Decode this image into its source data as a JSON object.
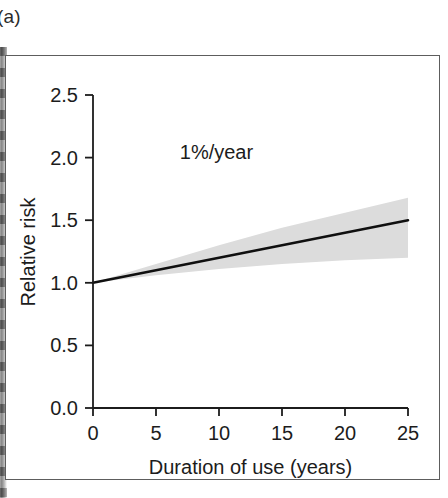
{
  "panel": {
    "label": "(a)"
  },
  "colors": {
    "axis": "#1c1c1c",
    "frame": "#5d5d5d",
    "trend_line": "#101010",
    "confidence_band": "#dcdcdc",
    "background": "#ffffff",
    "text": "#1c1c1c"
  },
  "chart_data": {
    "type": "line",
    "title": "",
    "subtitle": "",
    "xlabel": "Duration of use (years)",
    "ylabel": "Relative risk",
    "xlim": [
      0,
      25
    ],
    "ylim": [
      0.0,
      2.5
    ],
    "xticks": [
      0,
      5,
      10,
      15,
      20,
      25
    ],
    "xtick_labels": [
      "0",
      "5",
      "10",
      "15",
      "20",
      "25"
    ],
    "yticks": [
      0.0,
      0.5,
      1.0,
      1.5,
      2.0,
      2.5
    ],
    "ytick_labels": [
      "0.0",
      "0.5",
      "1.0",
      "1.5",
      "2.0",
      "2.5"
    ],
    "grid": false,
    "legend": false,
    "annotations": [
      {
        "text": "1%/year",
        "x": 9.8,
        "y": 2.04
      }
    ],
    "series": [
      {
        "name": "Relative risk",
        "style": "solid-line",
        "color": "#101010",
        "x": [
          0,
          5,
          10,
          15,
          20,
          25
        ],
        "values": [
          1.0,
          1.1,
          1.2,
          1.3,
          1.4,
          1.5
        ]
      }
    ],
    "confidence_band": {
      "name": "Confidence interval",
      "color": "#dcdcdc",
      "x": [
        0,
        5,
        10,
        15,
        20,
        25
      ],
      "lower": [
        1.0,
        1.06,
        1.11,
        1.15,
        1.18,
        1.2
      ],
      "upper": [
        1.0,
        1.15,
        1.3,
        1.44,
        1.56,
        1.68
      ]
    }
  }
}
